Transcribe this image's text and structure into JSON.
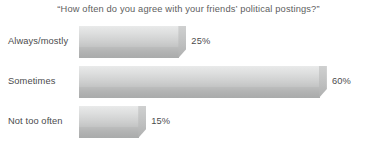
{
  "chart_data": {
    "type": "bar",
    "orientation": "horizontal",
    "title": "“How often do you agree with your friends’ political postings?”",
    "xlabel": "",
    "ylabel": "",
    "categories": [
      "Always/mostly",
      "Sometimes",
      "Not too often"
    ],
    "values": [
      25,
      60,
      15
    ],
    "value_labels": [
      "25%",
      "60%",
      "15%"
    ],
    "xlim": [
      0,
      67
    ],
    "grid": false,
    "legend": null,
    "units": "percent",
    "bar_style": "3d-beveled-gray",
    "colors": {
      "bar_face_light": "#e9eaea",
      "bar_face_dark": "#c3c4c4",
      "bar_base": "#b2b3b3",
      "title_text": "#5e5e60",
      "label_text": "#4b4b4d",
      "background": "#ffffff"
    }
  }
}
